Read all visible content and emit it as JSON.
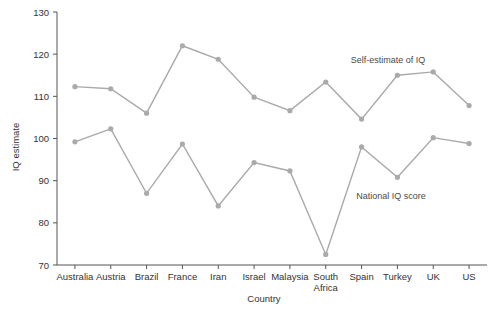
{
  "chart_data": {
    "type": "line",
    "title": "",
    "xlabel": "Country",
    "ylabel": "IQ estimate",
    "categories": [
      "Australia",
      "Austria",
      "Brazil",
      "France",
      "Iran",
      "Israel",
      "Malaysia",
      "South Africa",
      "Spain",
      "Turkey",
      "UK",
      "US"
    ],
    "ylim": [
      70,
      130
    ],
    "yticks": [
      70,
      80,
      90,
      100,
      110,
      120,
      130
    ],
    "ytick_labels": [
      "70",
      "80",
      "90",
      "100",
      "110",
      "120",
      "130"
    ],
    "grid": false,
    "legend_position": "inline-annotations",
    "series": [
      {
        "name": "Self-estimate of IQ",
        "color": "#aaaaaa",
        "values": [
          112.3,
          111.8,
          106.0,
          122.0,
          118.8,
          109.8,
          106.6,
          113.4,
          104.6,
          115.0,
          115.8,
          107.8
        ]
      },
      {
        "name": "National IQ score",
        "color": "#aaaaaa",
        "values": [
          99.2,
          102.3,
          87.0,
          98.7,
          84.0,
          94.3,
          92.3,
          72.5,
          98.0,
          90.8,
          100.2,
          98.8
        ]
      }
    ],
    "annotations": [
      {
        "text": "Self-estimate of IQ",
        "x_px": 388,
        "y_px": 63
      },
      {
        "text": "National IQ score",
        "x_px": 391,
        "y_px": 199
      }
    ]
  },
  "axes": {
    "x_tick_labels": [
      "Australia",
      "Austria",
      "Brazil",
      "France",
      "Iran",
      "Israel",
      "Malaysia",
      "South Africa",
      "Spain",
      "Turkey",
      "UK",
      "US"
    ],
    "y_tick_labels": [
      "130",
      "120",
      "110",
      "100",
      "90",
      "80",
      "70"
    ],
    "x_axis_title": "Country",
    "y_axis_title": "IQ estimate"
  },
  "colors": {
    "line": "#aaaaaa",
    "marker": "#a8a8a8",
    "axis": "#555555",
    "text": "#333333",
    "background": "#ffffff"
  }
}
